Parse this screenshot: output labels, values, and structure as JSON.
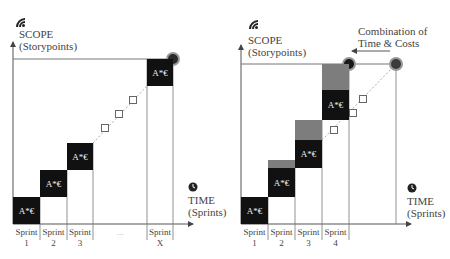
{
  "left_diagram": {
    "y_axis": {
      "title": "SCOPE",
      "subtitle": "(Storypoints)",
      "icon": "wifi-signal-icon"
    },
    "x_axis": {
      "title": "TIME",
      "subtitle": "(Sprints)",
      "icon": "clock-icon"
    },
    "block_label": "A*€",
    "sprints": [
      {
        "name": "Sprint",
        "number": "1"
      },
      {
        "name": "Sprint",
        "number": "2"
      },
      {
        "name": "Sprint",
        "number": "3"
      },
      {
        "name": "",
        "number": "..."
      },
      {
        "name": "Sprint",
        "number": "X"
      }
    ]
  },
  "right_diagram": {
    "y_axis": {
      "title": "SCOPE",
      "subtitle": "(Storypoints)",
      "icon": "wifi-signal-icon"
    },
    "x_axis": {
      "title": "TIME",
      "subtitle": "(Sprints)",
      "icon": "clock-icon"
    },
    "block_label": "A*€",
    "annotation": {
      "line1": "Combination of",
      "line2": "Time & Costs"
    },
    "sprints": [
      {
        "name": "Sprint",
        "number": "1"
      },
      {
        "name": "Sprint",
        "number": "2"
      },
      {
        "name": "Sprint",
        "number": "3"
      },
      {
        "name": "Sprint",
        "number": "4"
      }
    ]
  },
  "colors": {
    "block": "#111111",
    "overrun": "#7d7d7d",
    "axis": "#555555",
    "circle": "#2a2a2a"
  }
}
